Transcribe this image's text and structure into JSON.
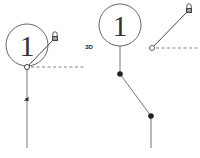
{
  "diagram": {
    "left": {
      "balloon": {
        "number": "1",
        "cx": 27,
        "cy": 45,
        "r": 21
      },
      "anchor_node": {
        "x": 27,
        "y": 67
      },
      "lock_icon": {
        "x": 55,
        "y": 36
      },
      "dashed_line": {
        "x1": 31,
        "y1": 67,
        "x2": 84,
        "y2": 67
      },
      "leader": {
        "x1": 27,
        "y1": 67,
        "x2": 27,
        "y2": 148
      },
      "marker": {
        "x": 27,
        "y": 99
      }
    },
    "right": {
      "label": "3D",
      "balloon": {
        "number": "1",
        "cx": 120,
        "cy": 25,
        "r": 21
      },
      "open_node": {
        "x": 152,
        "y": 48
      },
      "lock_icon": {
        "x": 189,
        "y": 8
      },
      "dashed_line": {
        "x1": 156,
        "y1": 48,
        "x2": 200,
        "y2": 48
      },
      "leader_points": [
        [
          120,
          46
        ],
        [
          120,
          74
        ],
        [
          151,
          116
        ],
        [
          151,
          148
        ]
      ],
      "filled_nodes": [
        [
          120,
          74
        ],
        [
          151,
          116
        ]
      ]
    },
    "colors": {
      "line": "#555555",
      "dash": "#666666",
      "node": "#222222"
    }
  }
}
